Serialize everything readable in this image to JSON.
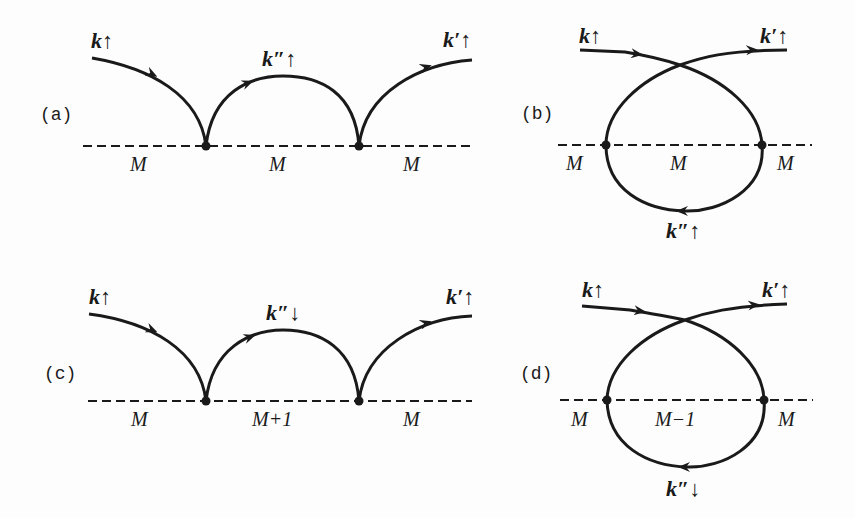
{
  "colors": {
    "ink": "#1a1a1a",
    "background": "#fdfdfd"
  },
  "panels": {
    "a": {
      "tag": "(a)",
      "incoming": "k↑",
      "intermediate": "k″↑",
      "outgoing": "k′↑",
      "m_labels": [
        "M",
        "M",
        "M"
      ]
    },
    "b": {
      "tag": "(b)",
      "incoming": "k↑",
      "intermediate": "k″↑",
      "outgoing": "k′↑",
      "m_labels": [
        "M",
        "M",
        "M"
      ]
    },
    "c": {
      "tag": "(c)",
      "incoming": "k↑",
      "intermediate": "k″↓",
      "outgoing": "k′↑",
      "m_labels": [
        "M",
        "M+1",
        "M"
      ]
    },
    "d": {
      "tag": "(d)",
      "incoming": "k↑",
      "intermediate": "k″↓",
      "outgoing": "k′↑",
      "m_labels": [
        "M",
        "M−1",
        "M"
      ]
    }
  }
}
